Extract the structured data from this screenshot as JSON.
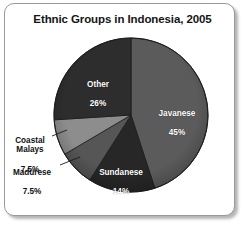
{
  "figure": {
    "title": "Ethnic Groups in Indonesia, 2005"
  },
  "chart_data": {
    "type": "pie",
    "title": "Ethnic Groups in Indonesia, 2005",
    "xlabel": "",
    "ylabel": "",
    "unit": "percent",
    "total": 100,
    "start_angle_deg": 0,
    "direction": "clockwise",
    "legend": "none",
    "grid": false,
    "categories": [
      "Javanese",
      "Sundanese",
      "Madurese",
      "Coastal Malays",
      "Other"
    ],
    "values": [
      45,
      14,
      7.5,
      7.5,
      26
    ],
    "slices": [
      {
        "name": "Javanese",
        "label": "Javanese",
        "value": 45,
        "value_text": "45%",
        "color": "#5b5b5b",
        "label_placement": "inside",
        "label_color": "#ffffff",
        "leader_line": false
      },
      {
        "name": "Sundanese",
        "label": "Sundanese",
        "value": 14,
        "value_text": "14%",
        "color": "#272727",
        "label_placement": "inside",
        "label_color": "#ffffff",
        "leader_line": false
      },
      {
        "name": "Madurese",
        "label": "Madurese",
        "value": 7.5,
        "value_text": "7.5%",
        "color": "#565656",
        "label_placement": "outside",
        "label_color": "#111111",
        "leader_line": true
      },
      {
        "name": "Coastal Malays",
        "label": "Coastal\nMalays",
        "value": 7.5,
        "value_text": "7.5%",
        "color": "#8d8d8d",
        "label_placement": "outside",
        "label_color": "#111111",
        "leader_line": true
      },
      {
        "name": "Other",
        "label": "Other",
        "value": 26,
        "value_text": "26%",
        "color": "#2d2d2d",
        "label_placement": "inside",
        "label_color": "#ffffff",
        "leader_line": false
      }
    ]
  },
  "labels": {
    "javanese": {
      "name": "Javanese",
      "pct": "45%"
    },
    "sundanese": {
      "name": "Sundanese",
      "pct": "14%"
    },
    "madurese": {
      "name": "Madurese",
      "pct": "7.5%"
    },
    "coastal_malays": {
      "name": "Coastal\nMalays",
      "pct": "7.5%"
    },
    "other": {
      "name": "Other",
      "pct": "26%"
    }
  },
  "style": {
    "frame_border": "#9a9a9a",
    "background": "#ffffff",
    "title_color": "#151515",
    "pie_outline": "#1b1b1b"
  }
}
